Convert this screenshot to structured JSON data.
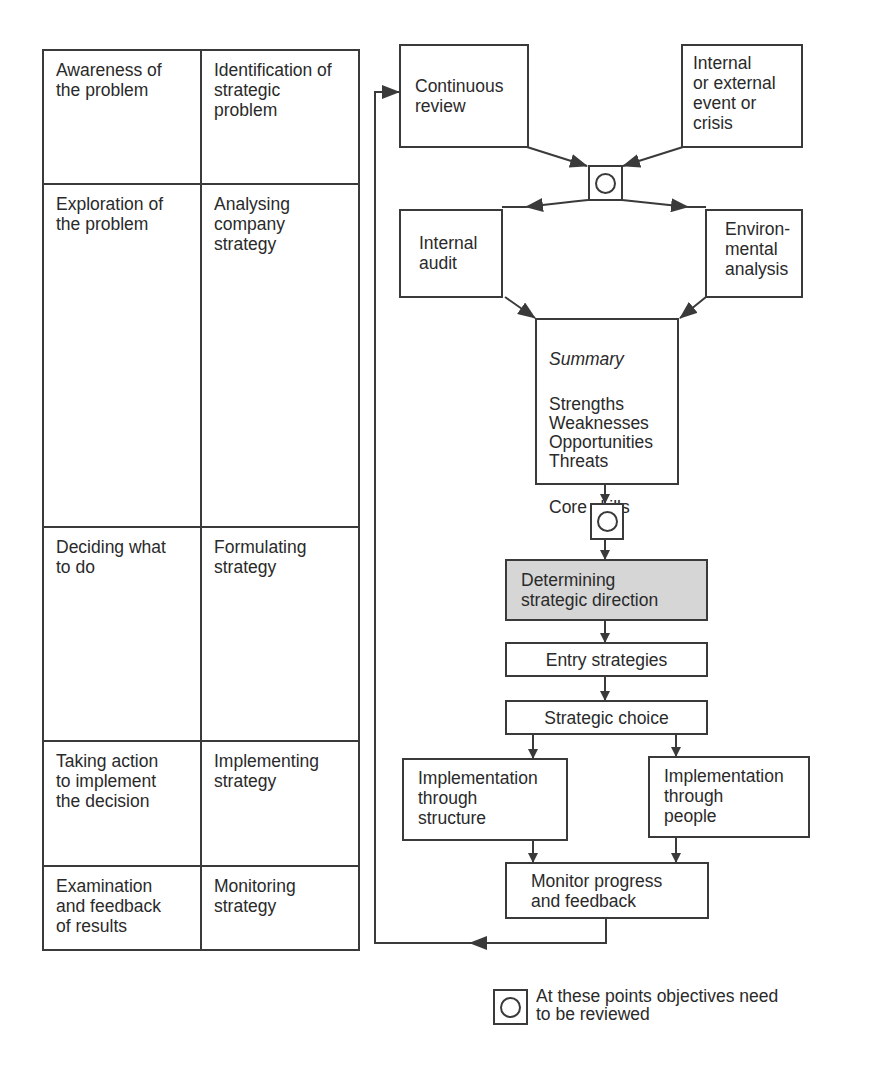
{
  "table": {
    "rows": [
      {
        "left": "Awareness of\nthe problem",
        "right": "Identification of\nstrategic\nproblem"
      },
      {
        "left": "Exploration of\nthe problem",
        "right": "Analysing\ncompany\nstrategy"
      },
      {
        "left": "Deciding what\nto do",
        "right": "Formulating\nstrategy"
      },
      {
        "left": "Taking action\nto implement\nthe decision",
        "right": "Implementing\nstrategy"
      },
      {
        "left": "Examination\nand feedback\nof results",
        "right": "Monitoring\nstrategy"
      }
    ]
  },
  "flowchart": {
    "continuous_review": "Continuous\nreview",
    "event_or_crisis": "Internal\nor external\nevent or\ncrisis",
    "internal_audit": "Internal\naudit",
    "environmental_analysis": "Environ-\nmental\nanalysis",
    "summary": {
      "title": "Summary",
      "swot": "Strengths\nWeaknesses\nOpportunities\nThreats",
      "core": "Core skills"
    },
    "strategic_direction": "Determining\nstrategic direction",
    "entry_strategies": "Entry strategies",
    "strategic_choice": "Strategic choice",
    "impl_structure": "Implementation\nthrough\nstructure",
    "impl_people": "Implementation\nthrough\npeople",
    "monitor": "Monitor progress\nand feedback"
  },
  "legend": {
    "text": "At these points objectives need\nto be reviewed",
    "symbol": "review-point-symbol"
  },
  "colors": {
    "line": "#3a3a3a",
    "shaded_box": "#d6d6d6",
    "text": "#2a2a2a"
  }
}
